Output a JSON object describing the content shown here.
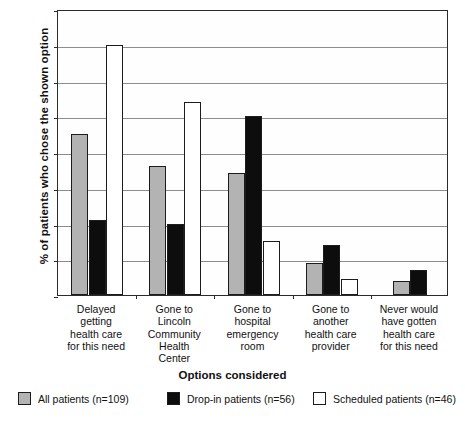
{
  "chart_data": {
    "type": "bar",
    "title": "",
    "xlabel": "Options considered",
    "ylabel": "% of patients who chose the shown option",
    "ylim": [
      0,
      80
    ],
    "ytick_labels": [
      "0%",
      "10%",
      "20%",
      "30%",
      "40%",
      "50%",
      "60%",
      "70%",
      "80%"
    ],
    "ytick_values": [
      0,
      10,
      20,
      30,
      40,
      50,
      60,
      70,
      80
    ],
    "grid": true,
    "legend_position": "bottom",
    "categories": [
      "Delayed getting health care for this need",
      "Gone to Lincoln Community Health Center",
      "Gone to hospital emergency room",
      "Gone to another health care provider",
      "Never would have gotten health care for this need"
    ],
    "category_lines": [
      [
        "Delayed",
        "getting",
        "health care",
        "for this need"
      ],
      [
        "Gone to",
        "Lincoln",
        "Community",
        "Health",
        "Center"
      ],
      [
        "Gone to",
        "hospital",
        "emergency",
        "room"
      ],
      [
        "Gone to",
        "another",
        "health care",
        "provider"
      ],
      [
        "Never would",
        "have gotten",
        "health care",
        "for this need"
      ]
    ],
    "series": [
      {
        "name": "All patients (n=109)",
        "color": "#b3b3b3",
        "values": [
          45,
          36,
          34,
          9,
          4
        ]
      },
      {
        "name": "Drop-in patients (n=56)",
        "color": "#0d0d0d",
        "values": [
          21,
          20,
          50,
          14,
          7
        ]
      },
      {
        "name": "Scheduled patients (n=46)",
        "color": "#ffffff",
        "values": [
          70,
          54,
          15,
          4.5,
          null
        ]
      }
    ]
  },
  "legend": {
    "items": [
      {
        "label": "All patients (n=109)",
        "swatch": "s0"
      },
      {
        "label": "Drop-in patients (n=56)",
        "swatch": "s1"
      },
      {
        "label": "Scheduled patients (n=46)",
        "swatch": "s2"
      }
    ]
  },
  "caption": {
    "text": ""
  }
}
